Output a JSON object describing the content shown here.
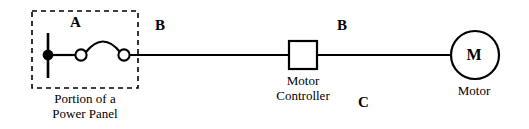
{
  "diagram": {
    "background_color": "#ffffff",
    "line_color": "#000000",
    "labels": {
      "segment_a": "A",
      "segment_b_left": "B",
      "segment_b_right": "B",
      "segment_c": "C",
      "motor_symbol": "M",
      "motor_caption": "Motor",
      "controller_caption_line1": "Motor",
      "controller_caption_line2": "Controller",
      "panel_caption_line1": "Portion of a",
      "panel_caption_line2": "Power Panel"
    },
    "components": {
      "power_panel_box": {
        "name": "Portion of a Power Panel",
        "style": "dashed-rectangle"
      },
      "junction_dot": {
        "name": "wire junction node",
        "style": "filled-circle"
      },
      "switch_contacts": {
        "name": "open switch contacts",
        "count": 2,
        "style": "open-circles-with-arc"
      },
      "motor_controller": {
        "name": "Motor Controller",
        "style": "square-box"
      },
      "motor": {
        "name": "Motor",
        "style": "circle-with-letter"
      }
    }
  }
}
